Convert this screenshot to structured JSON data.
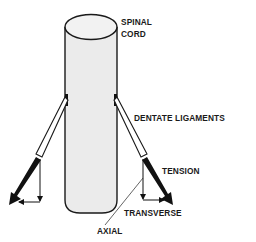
{
  "diagram": {
    "colors": {
      "background": "#ffffff",
      "cord_fill": "#ebebeb",
      "outline": "#1a1a1a",
      "arrow": "#111111"
    },
    "labels": {
      "spinal": "SPINAL",
      "cord": "CORD",
      "dentate_ligaments": "DENTATE LIGAMENTS",
      "tension": "TENSION",
      "transverse": "TRANSVERSE",
      "axial": "AXIAL"
    },
    "components": [
      {
        "name": "spinal-cord",
        "shape": "cylinder"
      },
      {
        "name": "dentate-ligament-left",
        "shape": "band"
      },
      {
        "name": "dentate-ligament-right",
        "shape": "band"
      },
      {
        "name": "tension-arrow-left",
        "shape": "thick-arrow"
      },
      {
        "name": "tension-arrow-right",
        "shape": "thick-arrow"
      },
      {
        "name": "axial-component-arrows",
        "shape": "thin-arrow"
      },
      {
        "name": "transverse-component-arrows",
        "shape": "thin-arrow"
      }
    ]
  }
}
